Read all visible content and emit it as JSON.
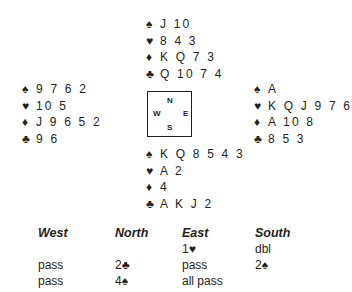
{
  "deal": {
    "north": {
      "spades": "J 10",
      "hearts": "8 4 3",
      "diamonds": "K Q 7 3",
      "clubs": "Q 10 7 4"
    },
    "west": {
      "spades": "9 7 6 2",
      "hearts": "10 5",
      "diamonds": "J 9 6 5 2",
      "clubs": "9 6"
    },
    "east": {
      "spades": "A",
      "hearts": "K Q J 9 7 6",
      "diamonds": "A 10 8",
      "clubs": "8 5 3"
    },
    "south": {
      "spades": "K Q 8 5 4 3",
      "hearts": "A 2",
      "diamonds": "4",
      "clubs": "A K J 2"
    }
  },
  "suit_symbols": {
    "spades": "♠",
    "hearts": "♥",
    "diamonds": "♦",
    "clubs": "♣"
  },
  "compass": {
    "n": "N",
    "s": "S",
    "w": "W",
    "e": "E"
  },
  "auction": {
    "headers": [
      "West",
      "North",
      "East",
      "South"
    ],
    "rows": [
      [
        "",
        "",
        "1♥",
        "dbl"
      ],
      [
        "pass",
        "2♣",
        "pass",
        "2♠"
      ],
      [
        "pass",
        "4♠",
        "all pass",
        ""
      ]
    ]
  }
}
